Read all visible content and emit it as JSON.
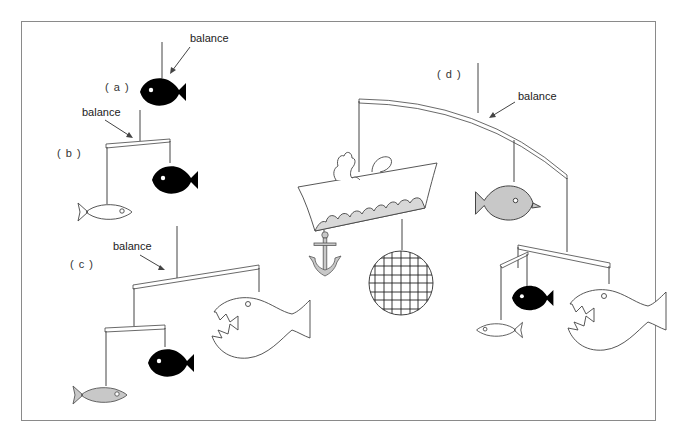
{
  "figure": {
    "panels": [
      {
        "id": "a",
        "label": "( a )",
        "annotation": "balance",
        "parts": [
          "single black fish"
        ]
      },
      {
        "id": "b",
        "label": "( b )",
        "annotation": "balance",
        "parts": [
          "white fish",
          "black fish"
        ]
      },
      {
        "id": "c",
        "label": "( c )",
        "annotation": "balance",
        "parts": [
          "gray fish",
          "black fish",
          "white piranha"
        ]
      },
      {
        "id": "d",
        "label": "( d )",
        "annotation": "balance",
        "parts": [
          "boat",
          "anchor",
          "net ball",
          "gray fish",
          "black fish",
          "white fish",
          "white piranha"
        ]
      }
    ]
  },
  "colors": {
    "black": "#000000",
    "gray": "#c8c8c8",
    "line": "#444444",
    "frame": "#8a8a8a"
  }
}
